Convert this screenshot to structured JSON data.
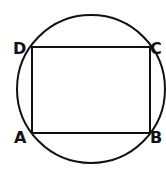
{
  "diagram": {
    "type": "inscribed-rectangle-in-circle",
    "circle": {
      "cx": 91,
      "cy": 89,
      "r": 74
    },
    "rectangle": {
      "x": 32,
      "y": 47,
      "width": 118,
      "height": 86
    },
    "labels": {
      "A": "A",
      "B": "B",
      "C": "C",
      "D": "D"
    },
    "stroke_color": "#111111"
  }
}
